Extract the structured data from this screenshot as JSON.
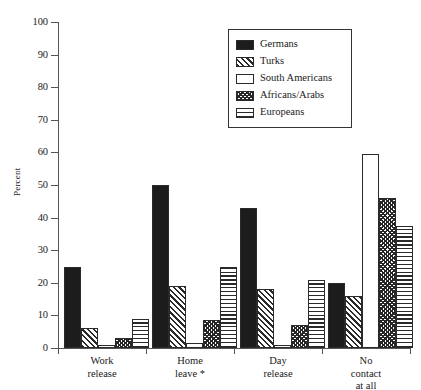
{
  "chart_data": {
    "type": "bar",
    "title": "",
    "xlabel": "",
    "ylabel": "Percent",
    "ylim": [
      0,
      100
    ],
    "ytick_step": 10,
    "grid": false,
    "legend_position": "upper-center",
    "categories": [
      "Work release",
      "Home leave *",
      "Day release",
      "No contact at all"
    ],
    "category_lines": [
      [
        "Work",
        "release"
      ],
      [
        "Home",
        "leave *"
      ],
      [
        "Day",
        "release"
      ],
      [
        "No",
        "contact",
        "at all"
      ]
    ],
    "ytick_labels": [
      "0",
      "10",
      "20",
      "30",
      "40",
      "50",
      "60",
      "70",
      "80",
      "90",
      "100"
    ],
    "series": [
      {
        "name": "Germans",
        "pattern": "solid",
        "values": [
          25,
          50,
          43,
          20
        ]
      },
      {
        "name": "Turks",
        "pattern": "diag",
        "values": [
          6,
          19,
          18,
          16
        ]
      },
      {
        "name": "South Americans",
        "pattern": "empty",
        "values": [
          1,
          1.5,
          1,
          59.5
        ]
      },
      {
        "name": "Africans/Arabs",
        "pattern": "cross",
        "values": [
          3,
          8.5,
          7,
          46
        ]
      },
      {
        "name": "Europeans",
        "pattern": "horiz",
        "values": [
          9,
          25,
          21,
          37.5
        ]
      }
    ]
  },
  "axis": {
    "y_label": "Percent"
  },
  "legend": {
    "items": [
      {
        "label": "Germans"
      },
      {
        "label": "Turks"
      },
      {
        "label": "South Americans"
      },
      {
        "label": "Africans/Arabs"
      },
      {
        "label": "Europeans"
      }
    ]
  },
  "colors": {
    "ink": "#1c1c1c",
    "axis": "#555555",
    "background": "#ffffff"
  }
}
